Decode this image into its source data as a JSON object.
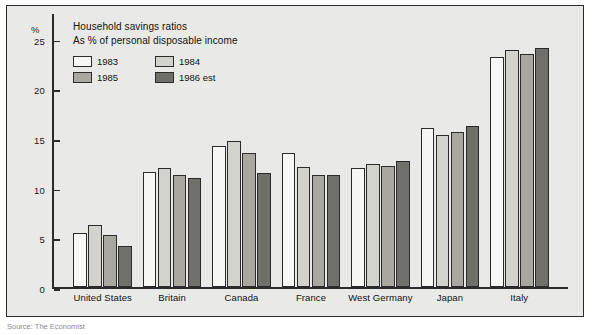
{
  "chart_data": {
    "type": "bar",
    "title": "Household savings ratios",
    "subtitle": "As % of personal disposable income",
    "xlabel": "",
    "ylabel": "%",
    "ylim": [
      0,
      27.5
    ],
    "yticks": [
      0,
      5,
      10,
      15,
      20,
      25
    ],
    "grid": false,
    "legend_position": "top-left",
    "categories": [
      "United States",
      "Britain",
      "Canada",
      "France",
      "West Germany",
      "Japan",
      "Italy"
    ],
    "series": [
      {
        "name": "1983",
        "color": "#f7f7f3",
        "values": [
          5.4,
          11.6,
          14.2,
          13.5,
          12.0,
          16.0,
          23.2
        ]
      },
      {
        "name": "1984",
        "color": "#d3d3cd",
        "values": [
          6.2,
          12.0,
          14.7,
          12.1,
          12.4,
          15.3,
          23.9
        ]
      },
      {
        "name": "1985",
        "color": "#a8a8a1",
        "values": [
          5.2,
          11.3,
          13.5,
          11.3,
          12.2,
          15.6,
          23.5
        ]
      },
      {
        "name": "1986 est",
        "color": "#70706a",
        "values": [
          4.1,
          11.0,
          11.5,
          11.3,
          12.7,
          16.2,
          24.1
        ]
      }
    ]
  },
  "caption": {
    "source_text": "Source: The Economist"
  },
  "colors": {
    "axis": "#2b2b2b",
    "panel_background": "#e9e9e7",
    "text": "#111111"
  }
}
